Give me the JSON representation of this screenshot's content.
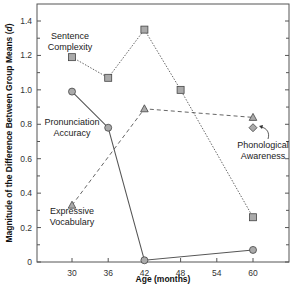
{
  "chart_data": {
    "type": "line",
    "title": "",
    "xlabel": "Age (months)",
    "ylabel": "Magnitude of the Difference Between Group Means (d)",
    "xlim": [
      24,
      66
    ],
    "ylim": [
      0,
      1.5
    ],
    "x_ticks": [
      "30",
      "36",
      "42",
      "48",
      "54",
      "60"
    ],
    "y_ticks": [
      "0",
      "0.2",
      "0.4",
      "0.6",
      "0.8",
      "1.0",
      "1.2",
      "1.4"
    ],
    "grid": false,
    "legend": "inline labels",
    "series": [
      {
        "name": "Sentence Complexity",
        "marker": "square",
        "line": "dotted",
        "x": [
          30,
          36,
          42,
          48,
          60
        ],
        "values": [
          1.19,
          1.07,
          1.35,
          1.0,
          0.26
        ]
      },
      {
        "name": "Pronunciation Accuracy",
        "marker": "circle",
        "line": "solid",
        "x": [
          30,
          36,
          42,
          60
        ],
        "values": [
          0.99,
          0.78,
          0.01,
          0.07
        ]
      },
      {
        "name": "Expressive Vocabulary",
        "marker": "triangle",
        "line": "dashed",
        "x": [
          30,
          42,
          60
        ],
        "values": [
          0.33,
          0.89,
          0.84
        ]
      },
      {
        "name": "Phonological Awareness",
        "marker": "diamond",
        "line": "none",
        "x": [
          60
        ],
        "values": [
          0.78
        ]
      }
    ]
  },
  "labels": {
    "sentence_complexity": [
      "Sentence",
      "Complexity"
    ],
    "pronunciation_accuracy": [
      "Pronunciation",
      "Accuracy"
    ],
    "expressive_vocabulary": [
      "Expressive",
      "Vocabulary"
    ],
    "phonological_awareness": [
      "Phonological",
      "Awareness"
    ]
  },
  "colors": {
    "line": "#555555",
    "marker_fill": "#aaaaaa",
    "marker_stroke": "#444444",
    "axis": "#555555"
  }
}
